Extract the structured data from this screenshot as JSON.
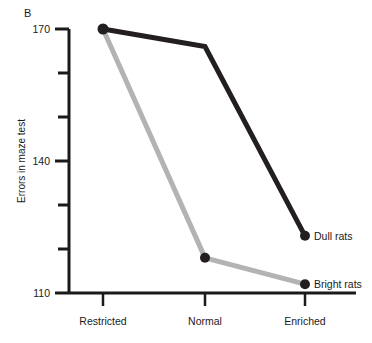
{
  "panel": {
    "label": "B"
  },
  "chart_data": {
    "type": "line",
    "title": "",
    "xlabel": "",
    "ylabel": "Errors in maze test",
    "categories": [
      "Restricted",
      "Normal",
      "Enriched"
    ],
    "series": [
      {
        "name": "Dull rats",
        "values": [
          170,
          166,
          123
        ],
        "color": "#231f20"
      },
      {
        "name": "Bright rats",
        "values": [
          170,
          118,
          112
        ],
        "color": "#b3b3b3"
      }
    ],
    "ylim": [
      110,
      170
    ],
    "yticks_major": [
      110,
      140,
      170
    ],
    "yticks_minor": [
      120,
      130,
      150,
      160
    ],
    "ytick_labels": [
      "110",
      "140",
      "170"
    ],
    "grid": false,
    "legend_position": "inline-right"
  },
  "axes": {
    "y_label_110": "110",
    "y_label_140": "140",
    "y_label_170": "170",
    "x_label_1": "Restricted",
    "x_label_2": "Normal",
    "x_label_3": "Enriched"
  },
  "legend": {
    "dull": "Dull rats",
    "bright": "Bright rats"
  },
  "colors": {
    "dull_line": "#231f20",
    "bright_line": "#b3b3b3",
    "axis": "#1a1a1a",
    "background": "#ffffff"
  }
}
